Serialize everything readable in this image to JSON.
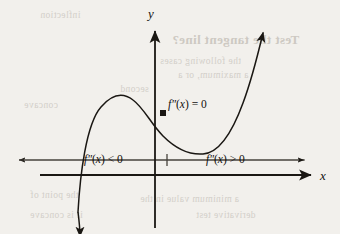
{
  "figure": {
    "caption_type": "concavity-inflection-diagram",
    "background_color": "#f2f0ec",
    "ink_color": "#1a1713"
  },
  "axes": {
    "x_axis_label": "x",
    "y_axis_label": "y",
    "x_axis": {
      "y": 175,
      "x_start": 40,
      "x_end": 312
    },
    "y_axis": {
      "x": 155,
      "y_start": 30,
      "y_end": 228
    }
  },
  "sign_line": {
    "y": 160,
    "x_start": 18,
    "x_end": 305,
    "tick_x": 167,
    "left_label": "f″(x) < 0",
    "right_label": "f″(x) > 0"
  },
  "curve": {
    "inflection_label": "f″(x) = 0",
    "inflection_point": {
      "x": 163,
      "y": 113
    },
    "local_max": {
      "x": 128,
      "y": 95
    },
    "local_min": {
      "x": 208,
      "y": 153
    },
    "arrow_start": {
      "x": 78,
      "y": 212
    },
    "arrow_end": {
      "x": 263,
      "y": 33
    },
    "path": "M 78 212 C 80 176, 86 124, 101 107 C 113 93, 124 93, 133 100 C 144 108, 151 124, 163 136 C 176 149, 190 155, 203 154 C 219 153, 232 133, 243 103 C 252 79, 258 54, 263 33"
  },
  "bleed_through": {
    "items": [
      {
        "text": "Test the tangent line?",
        "x": 172,
        "y": 38,
        "style": "head"
      },
      {
        "text": "the following cases",
        "x": 160,
        "y": 62,
        "style": "body"
      },
      {
        "text": "a maximum, or a",
        "x": 178,
        "y": 76,
        "style": "body"
      },
      {
        "text": "second",
        "x": 120,
        "y": 90,
        "style": "body"
      },
      {
        "text": "inflection",
        "x": 40,
        "y": 16,
        "style": "body"
      },
      {
        "text": "concave",
        "x": 24,
        "y": 106,
        "style": "body"
      },
      {
        "text": "the point of",
        "x": 30,
        "y": 196,
        "style": "body"
      },
      {
        "text": "a minimum value in the",
        "x": 140,
        "y": 200,
        "style": "body"
      },
      {
        "text": "derivative test",
        "x": 196,
        "y": 216,
        "style": "body"
      },
      {
        "text": "it is concave",
        "x": 30,
        "y": 216,
        "style": "body"
      }
    ]
  }
}
